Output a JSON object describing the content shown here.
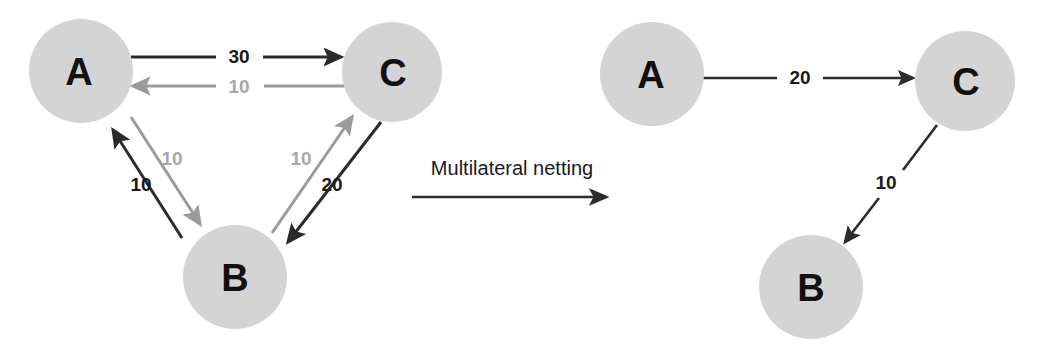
{
  "figure": {
    "title": "Multilateral netting",
    "background_color": "#ffffff",
    "node_fill_color": "#d4d4d4",
    "dark_stroke_color": "#2b2b2b",
    "gray_stroke_color": "#9a9a9a"
  },
  "process": {
    "label": "Multilateral netting",
    "arrow_direction": "right"
  },
  "before": {
    "caption": "Gross bilateral exposures before netting",
    "nodes": [
      {
        "id": "A",
        "label": "A",
        "cx": 81,
        "cy": 71,
        "r": 52
      },
      {
        "id": "C",
        "label": "C",
        "cx": 392,
        "cy": 72,
        "r": 50
      },
      {
        "id": "B",
        "label": "B",
        "cx": 235,
        "cy": 277,
        "r": 52
      }
    ],
    "edges": [
      {
        "from": "A",
        "to": "C",
        "value": "30",
        "color": "dark",
        "label_x": 239,
        "label_y": 55
      },
      {
        "from": "C",
        "to": "A",
        "value": "10",
        "color": "gray",
        "label_x": 239,
        "label_y": 86
      },
      {
        "from": "B",
        "to": "A",
        "value": "10",
        "color": "dark",
        "label_x": 142,
        "label_y": 183
      },
      {
        "from": "A",
        "to": "B",
        "value": "10",
        "color": "gray",
        "label_x": 172,
        "label_y": 158
      },
      {
        "from": "B",
        "to": "C",
        "value": "10",
        "color": "gray",
        "label_x": 300,
        "label_y": 158
      },
      {
        "from": "C",
        "to": "B",
        "value": "20",
        "color": "dark",
        "label_x": 332,
        "label_y": 183
      }
    ]
  },
  "after": {
    "caption": "Net exposures after multilateral netting",
    "nodes": [
      {
        "id": "A",
        "label": "A",
        "cx": 652,
        "cy": 74,
        "r": 52
      },
      {
        "id": "C",
        "label": "C",
        "cx": 965,
        "cy": 81,
        "r": 50
      },
      {
        "id": "B",
        "label": "B",
        "cx": 811,
        "cy": 287,
        "r": 52
      }
    ],
    "edges": [
      {
        "from": "A",
        "to": "C",
        "value": "20",
        "color": "dark",
        "label_x": 800,
        "label_y": 76
      },
      {
        "from": "C",
        "to": "B",
        "value": "10",
        "color": "dark",
        "label_x": 886,
        "label_y": 182
      }
    ]
  }
}
